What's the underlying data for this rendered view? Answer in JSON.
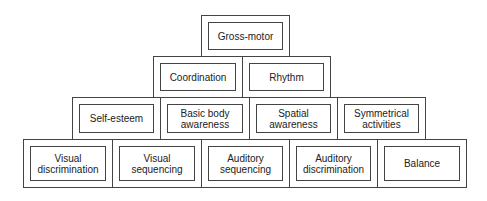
{
  "diagram": {
    "type": "pyramid",
    "rows": [
      {
        "cells": [
          {
            "label": "Gross-motor"
          }
        ]
      },
      {
        "cells": [
          {
            "label": "Coordination"
          },
          {
            "label": "Rhythm"
          }
        ]
      },
      {
        "cells": [
          {
            "label": "Self-esteem"
          },
          {
            "label": "Basic body\nawareness"
          },
          {
            "label": "Spatial\nawareness"
          },
          {
            "label": "Symmetrical\nactivities"
          }
        ]
      },
      {
        "cells": [
          {
            "label": "Visual\ndiscrimination"
          },
          {
            "label": "Visual\nsequencing"
          },
          {
            "label": "Auditory\nsequencing"
          },
          {
            "label": "Auditory\ndiscrimination"
          },
          {
            "label": "Balance"
          }
        ]
      }
    ]
  }
}
